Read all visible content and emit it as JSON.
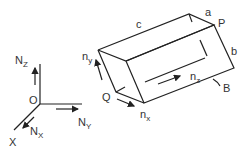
{
  "figure": {
    "global_frame": {
      "origin_label": "O",
      "axes": [
        {
          "axis": "Z",
          "label": "N",
          "subscript": "Z"
        },
        {
          "axis": "Y",
          "label": "N",
          "subscript": "Y"
        },
        {
          "axis": "X",
          "label": "N",
          "subscript": "X"
        }
      ],
      "x_axis_end_label": "X"
    },
    "body": {
      "shape": "rectangular box",
      "edge_labels": {
        "a": "a",
        "b": "b",
        "c": "c"
      },
      "point_labels": {
        "P": "P",
        "Q": "Q",
        "B": "B"
      },
      "local_axes": [
        {
          "label": "n",
          "subscript": "y"
        },
        {
          "label": "n",
          "subscript": "z"
        },
        {
          "label": "n",
          "subscript": "x"
        }
      ]
    }
  }
}
